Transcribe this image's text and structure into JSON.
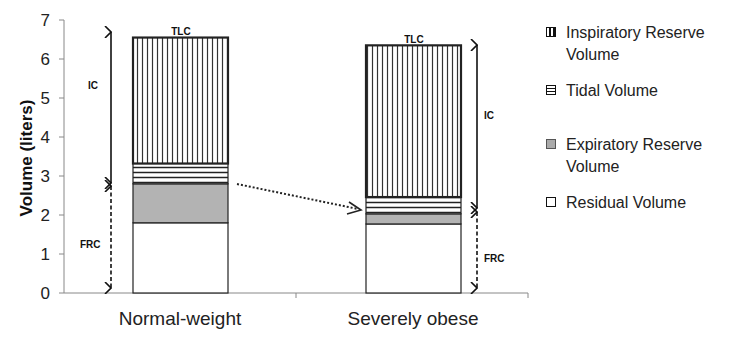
{
  "chart_data": {
    "type": "bar",
    "stacked": true,
    "title": "",
    "xlabel": "",
    "ylabel": "Volume (liters)",
    "ylim": [
      0,
      7
    ],
    "yticks": [
      0,
      1,
      2,
      3,
      4,
      5,
      6,
      7
    ],
    "grid": false,
    "legend_position": "right",
    "categories": [
      "Normal-weight",
      "Severely obese"
    ],
    "series": [
      {
        "name": "Residual Volume",
        "values": [
          1.8,
          1.77
        ],
        "fill": "#ffffff",
        "pattern": "none"
      },
      {
        "name": "Expiratory Reserve Volume",
        "values": [
          1.0,
          0.26
        ],
        "fill": "#b3b3b3",
        "pattern": "solid-gray"
      },
      {
        "name": "Tidal Volume",
        "values": [
          0.52,
          0.43
        ],
        "fill": "#ffffff",
        "pattern": "horizontal-lines"
      },
      {
        "name": "Inspiratory Reserve Volume",
        "values": [
          3.23,
          3.89
        ],
        "fill": "#ffffff",
        "pattern": "vertical-lines"
      }
    ],
    "totals": {
      "TLC": [
        6.55,
        6.35
      ]
    },
    "annotations": [
      {
        "label": "TLC",
        "target": "Normal-weight",
        "position": "top of bar"
      },
      {
        "label": "TLC",
        "target": "Severely obese",
        "position": "top of bar"
      },
      {
        "label": "IC",
        "target": "Normal-weight",
        "from": 2.82,
        "to": 6.55,
        "style": "solid double arrow"
      },
      {
        "label": "FRC",
        "target": "Normal-weight",
        "from": 0,
        "to": 2.8,
        "style": "dashed double arrow"
      },
      {
        "label": "IC",
        "target": "Severely obese",
        "from": 2.03,
        "to": 6.35,
        "style": "solid double arrow"
      },
      {
        "label": "FRC",
        "target": "Severely obese",
        "from": 0,
        "to": 2.03,
        "style": "dashed double arrow"
      },
      {
        "label": "",
        "from": "Normal-weight FRC top",
        "to": "Severely obese FRC top",
        "style": "dotted arrow"
      }
    ]
  },
  "axis": {
    "ylabel": "Volume (liters)",
    "yticks": [
      "0",
      "1",
      "2",
      "3",
      "4",
      "5",
      "6",
      "7"
    ],
    "categories": [
      "Normal-weight",
      "Severely obese"
    ]
  },
  "annotations": {
    "tlc": "TLC",
    "ic": "IC",
    "frc": "FRC"
  },
  "legend": {
    "items": [
      {
        "line1": "Inspiratory Reserve",
        "line2": "Volume",
        "pattern": "vertical-lines"
      },
      {
        "line1": "Tidal Volume",
        "line2": "",
        "pattern": "horizontal-lines"
      },
      {
        "line1": "Expiratory Reserve",
        "line2": "Volume",
        "pattern": "solid-gray"
      },
      {
        "line1": "Residual Volume",
        "line2": "",
        "pattern": "none"
      }
    ]
  },
  "colors": {
    "erv_fill": "#b3b3b3",
    "stroke": "#111111",
    "axis": "#888888"
  }
}
